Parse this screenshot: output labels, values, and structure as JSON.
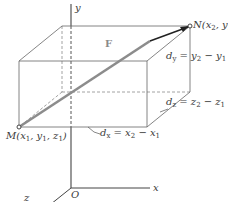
{
  "diagram": {
    "axes": {
      "x_label": "x",
      "y_label": "y",
      "z_label": "z",
      "origin_label": "O"
    },
    "points": {
      "M": {
        "name": "M",
        "coords": [
          "x",
          "y",
          "z"
        ],
        "label": "M(x1, y1, z1)"
      },
      "N": {
        "name": "N",
        "label": "N(x2, y2, z2)"
      }
    },
    "vector_label": "F",
    "components": {
      "dx": "dx = x2 − x1",
      "dy": "dy = y2 − y1",
      "dz": "dz = z2 − z1 < 0"
    },
    "colors": {
      "line": "#555555",
      "dashed": "#777777",
      "vector": "#8c8c8c",
      "vector_tip": "#222222",
      "text": "#3a3a3a"
    }
  }
}
